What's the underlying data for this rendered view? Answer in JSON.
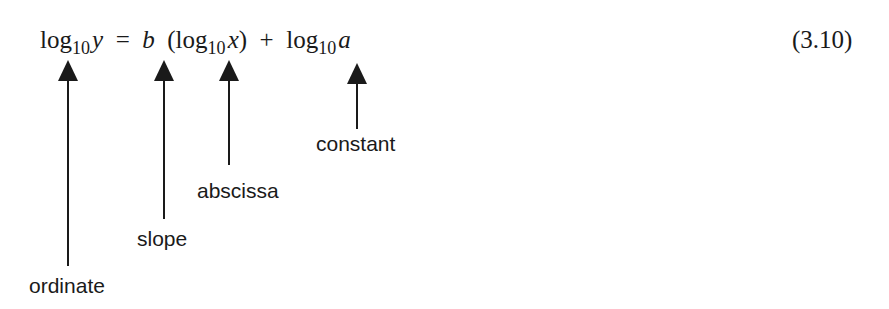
{
  "equation": {
    "number": "(3.10)",
    "parts": {
      "lhs_log": "log",
      "lhs_base": "10",
      "lhs_var": "y",
      "equals": "=",
      "slope_var": "b",
      "open_paren": "(log",
      "x_base": "10",
      "x_var": "x",
      "close_paren": ")",
      "plus": "+",
      "const_log": "log",
      "const_base": "10",
      "const_var": "a"
    },
    "full_text": "log10 y = b (log10 x) + log10 a"
  },
  "annotations": [
    {
      "label": "ordinate",
      "points_to": "log10 y"
    },
    {
      "label": "slope",
      "points_to": "b"
    },
    {
      "label": "abscissa",
      "points_to": "log10 x"
    },
    {
      "label": "constant",
      "points_to": "log10 a"
    }
  ],
  "colors": {
    "ink": "#1a1a1a",
    "background": "#ffffff"
  }
}
